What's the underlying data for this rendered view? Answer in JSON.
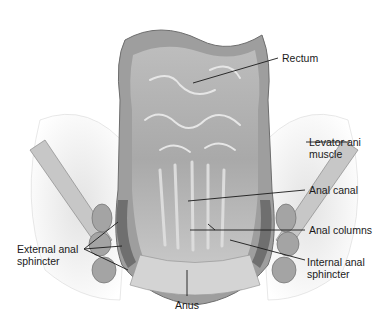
{
  "figure": {
    "labels": {
      "rectum": "Rectum",
      "levator_ani": "Levator ani\nmuscle",
      "anal_canal": "Anal canal",
      "anal_columns": "Anal columns",
      "internal_sphincter": "Internal anal\nsphincter",
      "external_sphincter": "External anal\nsphincter",
      "anus": "Anus"
    },
    "colors": {
      "ink": "#1a1a1a",
      "tissue_dark": "#8c8c8c",
      "tissue_mid": "#b4b4b4",
      "tissue_light": "#d8d8d8",
      "fat": "#ececec"
    }
  }
}
